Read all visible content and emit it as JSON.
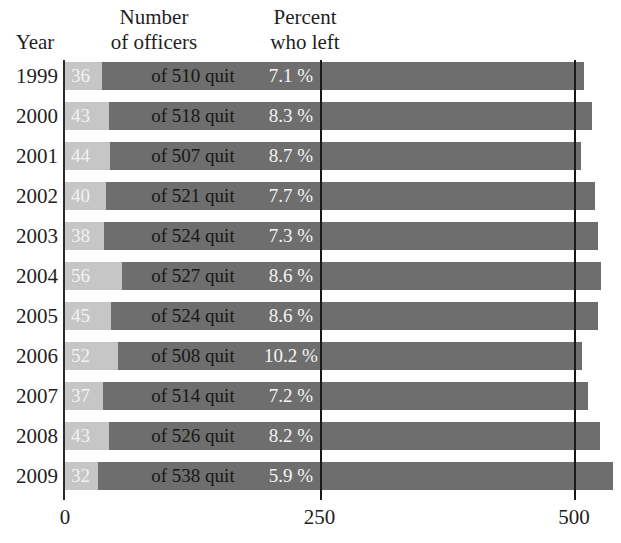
{
  "header": {
    "year_label": "Year",
    "number_label_line1": "Number",
    "number_label_line2": "of officers",
    "percent_label_line1": "Percent",
    "percent_label_line2": "who left"
  },
  "colors": {
    "bar_total": "#6e6e6e",
    "bar_quit": "#c6c6c6",
    "gridline": "#1a1a1a",
    "axis": "#2a2a2a",
    "text_dark": "#171717",
    "text_light": "#f2f2f2"
  },
  "chart_data": {
    "type": "bar",
    "title": "",
    "subtitle": "",
    "xlabel": "",
    "ylabel": "Year",
    "xlim": [
      0,
      560
    ],
    "grid": true,
    "gridlines": [
      250,
      500
    ],
    "legend_position": "none",
    "orientation": "horizontal",
    "stacked": true,
    "categories": [
      "1999",
      "2000",
      "2001",
      "2002",
      "2003",
      "2004",
      "2005",
      "2006",
      "2007",
      "2008",
      "2009"
    ],
    "series": [
      {
        "name": "Officers who quit",
        "values": [
          36,
          43,
          44,
          40,
          38,
          56,
          45,
          52,
          37,
          43,
          32
        ]
      },
      {
        "name": "Total officers",
        "values": [
          510,
          518,
          507,
          521,
          524,
          527,
          524,
          508,
          514,
          526,
          538
        ]
      }
    ],
    "percent_who_left": [
      7.1,
      8.3,
      8.7,
      7.7,
      7.3,
      8.6,
      8.6,
      10.2,
      7.2,
      8.2,
      5.9
    ],
    "xticks": [
      0,
      250,
      500
    ],
    "xtick_labels": [
      "0",
      "250",
      "500"
    ]
  },
  "rows": [
    {
      "year": "1999",
      "quit": "36",
      "of_total": "of 510 quit",
      "percent": "7.1 %",
      "quit_value": 36,
      "total_value": 510
    },
    {
      "year": "2000",
      "quit": "43",
      "of_total": "of 518 quit",
      "percent": "8.3 %",
      "quit_value": 43,
      "total_value": 518
    },
    {
      "year": "2001",
      "quit": "44",
      "of_total": "of 507 quit",
      "percent": "8.7 %",
      "quit_value": 44,
      "total_value": 507
    },
    {
      "year": "2002",
      "quit": "40",
      "of_total": "of 521 quit",
      "percent": "7.7 %",
      "quit_value": 40,
      "total_value": 521
    },
    {
      "year": "2003",
      "quit": "38",
      "of_total": "of 524 quit",
      "percent": "7.3 %",
      "quit_value": 38,
      "total_value": 524
    },
    {
      "year": "2004",
      "quit": "56",
      "of_total": "of 527 quit",
      "percent": "8.6 %",
      "quit_value": 56,
      "total_value": 527
    },
    {
      "year": "2005",
      "quit": "45",
      "of_total": "of 524 quit",
      "percent": "8.6 %",
      "quit_value": 45,
      "total_value": 524
    },
    {
      "year": "2006",
      "quit": "52",
      "of_total": "of 508 quit",
      "percent": "10.2 %",
      "quit_value": 52,
      "total_value": 508
    },
    {
      "year": "2007",
      "quit": "37",
      "of_total": "of 514 quit",
      "percent": "7.2 %",
      "quit_value": 37,
      "total_value": 514
    },
    {
      "year": "2008",
      "quit": "43",
      "of_total": "of 526 quit",
      "percent": "8.2 %",
      "quit_value": 43,
      "total_value": 526
    },
    {
      "year": "2009",
      "quit": "32",
      "of_total": "of 538 quit",
      "percent": "5.9 %",
      "quit_value": 32,
      "total_value": 538
    }
  ],
  "axis": {
    "ticks": [
      "0",
      "250",
      "500"
    ]
  }
}
